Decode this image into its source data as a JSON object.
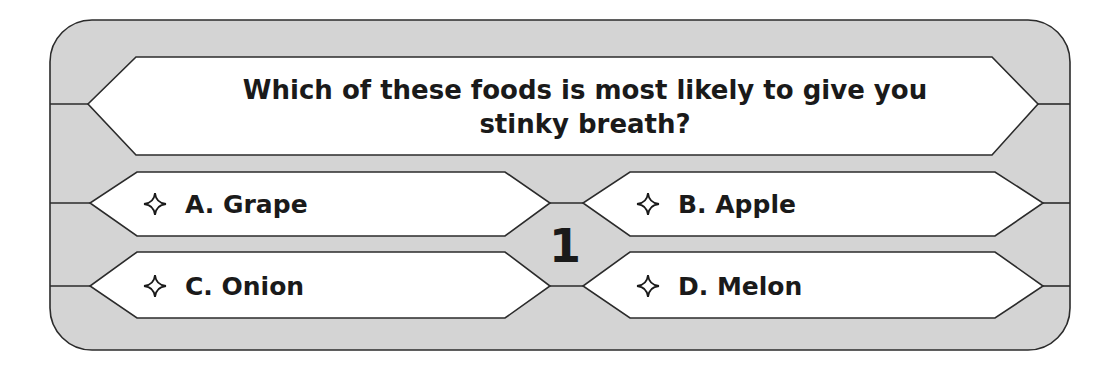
{
  "question": {
    "line1": "Which of these foods is most likely to give you",
    "line2": "stinky breath?"
  },
  "answers": [
    {
      "letter": "A",
      "label": "A. Grape",
      "icon": "four-point-star-outline-icon"
    },
    {
      "letter": "B",
      "label": "B. Apple",
      "icon": "four-point-star-outline-icon"
    },
    {
      "letter": "C",
      "label": "C. Onion",
      "icon": "four-point-star-outline-icon"
    },
    {
      "letter": "D",
      "label": "D. Melon",
      "icon": "four-point-star-outline-icon"
    }
  ],
  "level": "1",
  "colors": {
    "panel": "#d4d4d4",
    "box": "#ffffff",
    "outline": "#2b2b2b",
    "text": "#1a1a1a"
  }
}
